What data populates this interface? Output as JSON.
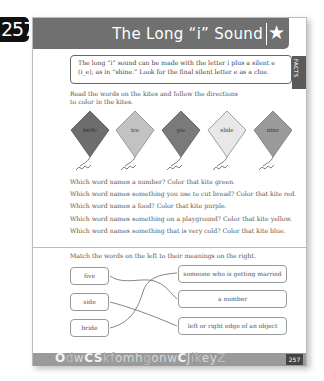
{
  "page_badge": "257",
  "header": {
    "title": "The Long “i” Sound",
    "icon": "star-icon"
  },
  "facts": {
    "text_line1": "The long “i” sound can be made with the letter i plus a silent e",
    "text_line2": "(i_e), as in “shine.” Look for the final silent letter e as a clue.",
    "tab_label": "FACTS"
  },
  "instructions": {
    "line1": "Read the words on the kites and follow the directions",
    "line2": "to color in the kites."
  },
  "kites": [
    {
      "word": "knife",
      "fill": "#6d6d6d"
    },
    {
      "word": "ice",
      "fill": "#c2c2c2"
    },
    {
      "word": "pie",
      "fill": "#7a7a7a"
    },
    {
      "word": "slide",
      "fill": "#e8e8e8"
    },
    {
      "word": "nine",
      "fill": "#9a9a9a"
    }
  ],
  "questions": [
    "Which word names a number? Color that kite green.",
    "Which word names something you use to cut bread? Color that kite red.",
    "Which word names a food? Color that kite purple.",
    "Which word names something on a playground? Color that kite yellow.",
    "Which word names something that is very cold? Color that kite blue."
  ],
  "matching": {
    "title": "Match the words on the left to their meanings on the right.",
    "left": [
      "five",
      "side",
      "bride"
    ],
    "right": [
      "someone who is getting married",
      "a number",
      "left or right edge of an object"
    ]
  },
  "footer": {
    "letters": "OdwCSkfomhgonwCJikeyZ",
    "page_number": "257"
  }
}
